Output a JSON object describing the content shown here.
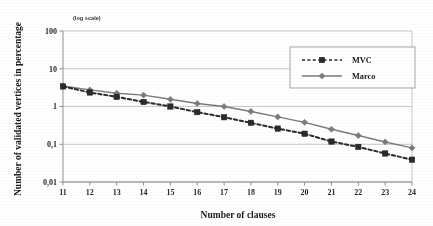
{
  "chart_data": {
    "type": "line",
    "title": "",
    "xlabel": "Number  of clauses",
    "ylabel": "Number of validated vertices in percentage",
    "scale_note": "(log scale)",
    "yscale": "log",
    "ylim": [
      0.01,
      100
    ],
    "ytick_labels": [
      "100",
      "10",
      "1",
      "0,1",
      "0,01"
    ],
    "ytick_values": [
      100,
      10,
      1,
      0.1,
      0.01
    ],
    "xtick_labels": [
      "11",
      "12",
      "13",
      "14",
      "15",
      "16",
      "17",
      "18",
      "19",
      "20",
      "21",
      "22",
      "23",
      "24"
    ],
    "x": [
      11,
      12,
      13,
      14,
      15,
      16,
      17,
      18,
      19,
      20,
      21,
      22,
      23,
      24
    ],
    "grid": "horizontal",
    "legend_position": "upper-right-inside",
    "series": [
      {
        "name": "MVC",
        "color": "#2b2b2b",
        "linestyle": "dashed",
        "marker": "square",
        "values": [
          3.4,
          2.35,
          1.8,
          1.32,
          1.0,
          0.71,
          0.52,
          0.37,
          0.26,
          0.19,
          0.118,
          0.085,
          0.057,
          0.039
        ]
      },
      {
        "name": "Marco",
        "color": "#7b7b7b",
        "linestyle": "solid",
        "marker": "diamond",
        "values": [
          3.5,
          2.75,
          2.25,
          2.0,
          1.55,
          1.2,
          1.0,
          0.74,
          0.53,
          0.38,
          0.25,
          0.17,
          0.115,
          0.08
        ]
      }
    ]
  },
  "legend": {
    "entries": [
      {
        "label": "MVC"
      },
      {
        "label": "Marco"
      }
    ]
  },
  "axes": {
    "x_title": "Number  of clauses",
    "y_title": "Number of validated vertices in percentage",
    "log_note": "(log scale)"
  }
}
